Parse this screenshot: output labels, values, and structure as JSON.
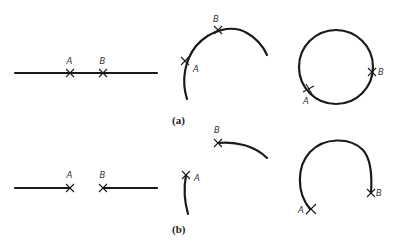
{
  "figure": {
    "panel_a": {
      "caption": "(a)",
      "straight": {
        "point_a": "A",
        "point_b": "B"
      },
      "arc": {
        "point_a": "A",
        "point_b": "B"
      },
      "circle": {
        "point_a": "A",
        "point_b": "B"
      }
    },
    "panel_b": {
      "caption": "(b)",
      "straight": {
        "point_a": "A",
        "point_b": "B"
      },
      "arc": {
        "point_a": "A",
        "point_b": "B"
      },
      "circle": {
        "point_a": "A",
        "point_b": "B"
      }
    }
  },
  "colors": {
    "stroke": "#1a1a1a",
    "background": "#ffffff"
  }
}
